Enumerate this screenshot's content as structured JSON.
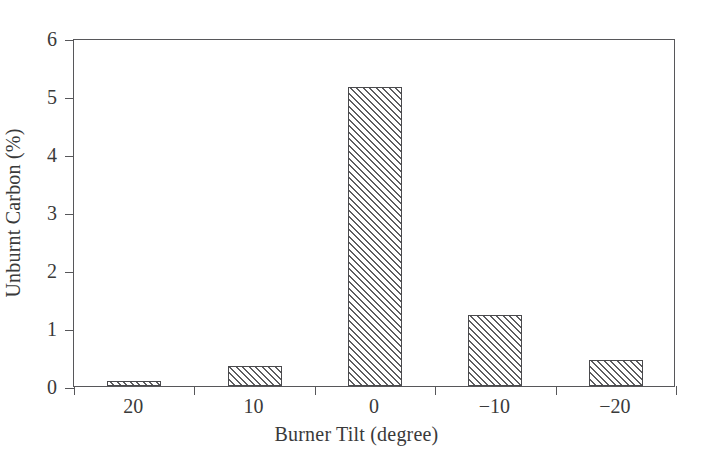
{
  "chart_data": {
    "type": "bar",
    "title": "",
    "xlabel": "Burner Tilt (degree)",
    "ylabel": "Unburnt Carbon (%)",
    "categories": [
      "20",
      "10",
      "0",
      "−10",
      "−20"
    ],
    "values": [
      0.08,
      0.35,
      5.15,
      1.23,
      0.44
    ],
    "series": [
      {
        "name": "Unburnt Carbon",
        "values": [
          0.08,
          0.35,
          5.15,
          1.23,
          0.44
        ]
      }
    ],
    "ylim": [
      0,
      6
    ],
    "ytick_labels": [
      "0",
      "1",
      "2",
      "3",
      "4",
      "5",
      "6"
    ],
    "ytick_values": [
      0,
      1,
      2,
      3,
      4,
      5,
      6
    ],
    "xtick_labels": [
      "20",
      "10",
      "0",
      "−10",
      "−20"
    ],
    "grid": false,
    "legend": false,
    "legend_position": "none",
    "bar_fill": "hatched-diagonal",
    "colors": {
      "axis": "#57575a",
      "bar_edge": "#4a4a4d",
      "hatch": "#5d5d60",
      "background": "#ffffff",
      "text": "#3a3a3a"
    }
  }
}
